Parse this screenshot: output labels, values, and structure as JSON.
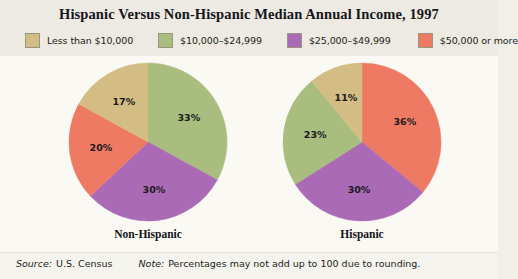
{
  "title": "Hispanic Versus Non-Hispanic Median Annual Income, 1997",
  "legend": [
    {
      "label": "Less than $10,000",
      "color": "#d3bd84"
    },
    {
      "label": "$10,000–$24,999",
      "color": "#a9bd7e"
    },
    {
      "label": "$25,000–$49,999",
      "color": "#ab6ab5"
    },
    {
      "label": "$50,000 or more",
      "color": "#ef7a63"
    }
  ],
  "footer": {
    "source_lead": "Source:",
    "source_text": "U.S. Census",
    "note_lead": "Note:",
    "note_text": "Percentages may not add up to 100 due to rounding."
  },
  "captions": {
    "left": "Non-Hispanic",
    "right": "Hispanic"
  },
  "chart_data": {
    "type": "pie",
    "title": "Hispanic Versus Non-Hispanic Median Annual Income, 1997",
    "units": "percent",
    "legend_position": "top",
    "categories": [
      "Less than $10,000",
      "$10,000–$24,999",
      "$25,000–$49,999",
      "$50,000 or more"
    ],
    "colors": [
      "#d3bd84",
      "#a9bd7e",
      "#ab6ab5",
      "#ef7a63"
    ],
    "charts": [
      {
        "name": "Non-Hispanic",
        "start_angle_deg": 0,
        "direction": "clockwise",
        "slices": [
          {
            "category": "$10,000–$24,999",
            "value": 33,
            "label": "33%",
            "color": "#a9bd7e"
          },
          {
            "category": "$25,000–$49,999",
            "value": 30,
            "label": "30%",
            "color": "#ab6ab5"
          },
          {
            "category": "$50,000 or more",
            "value": 20,
            "label": "20%",
            "color": "#ef7a63"
          },
          {
            "category": "Less than $10,000",
            "value": 17,
            "label": "17%",
            "color": "#d3bd84"
          }
        ]
      },
      {
        "name": "Hispanic",
        "start_angle_deg": 0,
        "direction": "clockwise",
        "slices": [
          {
            "category": "$50,000 or more",
            "value": 36,
            "label": "36%",
            "color": "#ef7a63"
          },
          {
            "category": "$25,000–$49,999",
            "value": 30,
            "label": "30%",
            "color": "#ab6ab5"
          },
          {
            "category": "$10,000–$24,999",
            "value": 23,
            "label": "23%",
            "color": "#a9bd7e"
          },
          {
            "category": "Less than $10,000",
            "value": 11,
            "label": "11%",
            "color": "#d3bd84"
          }
        ]
      }
    ],
    "source": "Source: U.S. Census",
    "note": "Note: Percentages may not add up to 100 due to rounding."
  }
}
